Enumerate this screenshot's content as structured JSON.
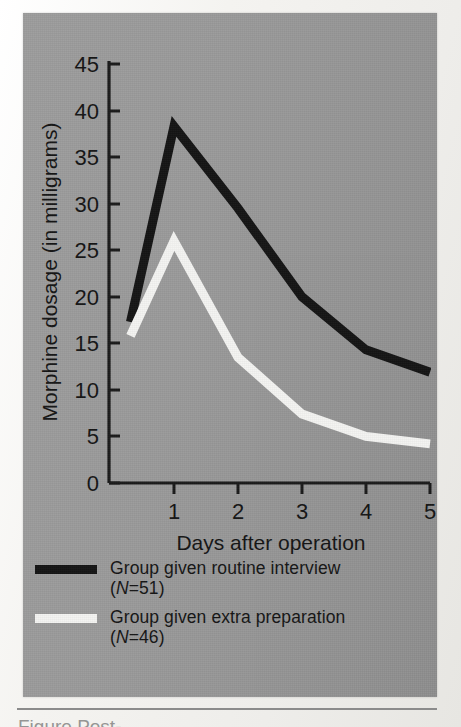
{
  "figure": {
    "panel_color": "#979797",
    "page_color": "#f2f1ee"
  },
  "axes": {
    "y_label": "Morphine dosage (in milligrams)",
    "x_label": "Days after operation",
    "y_ticks": [
      "0",
      "5",
      "10",
      "15",
      "20",
      "25",
      "30",
      "35",
      "40",
      "45"
    ],
    "x_ticks": [
      "1",
      "2",
      "3",
      "4",
      "5"
    ]
  },
  "legend": {
    "items": [
      {
        "swatch": "black",
        "color": "#141414",
        "line1": "Group given routine interview",
        "n_prefix": "(",
        "n_symbol": "N",
        "n_value": "=51)"
      },
      {
        "swatch": "white",
        "color": "#f4f4f2",
        "line1": "Group given extra preparation",
        "n_prefix": "(",
        "n_symbol": "N",
        "n_value": "=46)"
      }
    ]
  },
  "caption": {
    "sliver_text": "Figure    Post-"
  },
  "chart_data": {
    "type": "line",
    "title": "",
    "xlabel": "Days after operation",
    "ylabel": "Morphine dosage (in milligrams)",
    "xlim": [
      0.3,
      5.0
    ],
    "ylim": [
      0,
      45
    ],
    "y_ticks": [
      0,
      5,
      10,
      15,
      20,
      25,
      30,
      35,
      40,
      45
    ],
    "x_ticks": [
      1,
      2,
      3,
      4,
      5
    ],
    "grid": false,
    "legend_position": "below-axes",
    "x": [
      0.32,
      1,
      2,
      3,
      4,
      5
    ],
    "series": [
      {
        "name": "Group given routine interview (N=51)",
        "color": "#141414",
        "values": [
          17.3,
          38.3,
          29.5,
          20.0,
          14.3,
          11.9
        ]
      },
      {
        "name": "Group given extra preparation (N=46)",
        "color": "#f4f4f2",
        "values": [
          15.8,
          26.0,
          13.5,
          7.4,
          5.0,
          4.2
        ]
      }
    ]
  }
}
